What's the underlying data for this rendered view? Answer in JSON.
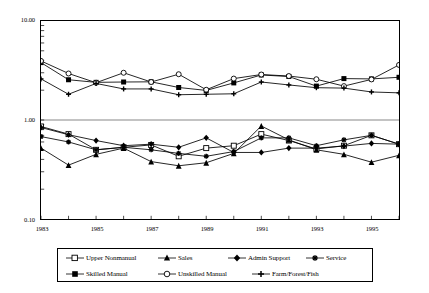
{
  "chart_data": {
    "type": "line",
    "title": "",
    "subtitle": "",
    "xlabel": "",
    "ylabel": "",
    "yscale": "log",
    "ylim": [
      0.1,
      10.0
    ],
    "grid": false,
    "gridlines": [
      "1.00"
    ],
    "legend_position": "bottom",
    "x": [
      1983,
      1984,
      1985,
      1986,
      1987,
      1988,
      1989,
      1990,
      1991,
      1992,
      1993,
      1994,
      1995,
      1996
    ],
    "x_tick_labels": [
      "1983",
      "1985",
      "1987",
      "1989",
      "1991",
      "1993",
      "1995"
    ],
    "x_tick_values": [
      1983,
      1985,
      1987,
      1989,
      1991,
      1993,
      1995
    ],
    "y_tick_labels": [
      "10.00",
      "1.00",
      "0.10"
    ],
    "y_tick_values": [
      10.0,
      1.0,
      0.1
    ],
    "series": [
      {
        "name": "Upper Nonmanual",
        "marker": "open-square",
        "values": [
          0.86,
          0.72,
          0.5,
          0.53,
          0.56,
          0.43,
          0.52,
          0.55,
          0.72,
          0.62,
          0.51,
          0.55,
          0.7,
          0.57
        ]
      },
      {
        "name": "Sales",
        "marker": "filled-triangle",
        "values": [
          0.52,
          0.35,
          0.45,
          0.52,
          0.38,
          0.345,
          0.37,
          0.46,
          0.87,
          0.63,
          0.5,
          0.45,
          0.375,
          0.44
        ]
      },
      {
        "name": "Admin Support",
        "marker": "filled-diamond",
        "values": [
          0.84,
          0.71,
          0.62,
          0.55,
          0.57,
          0.53,
          0.66,
          0.47,
          0.47,
          0.52,
          0.52,
          0.545,
          0.58,
          0.57
        ]
      },
      {
        "name": "Service",
        "marker": "filled-star",
        "values": [
          0.68,
          0.6,
          0.5,
          0.53,
          0.5,
          0.46,
          0.43,
          0.48,
          0.66,
          0.66,
          0.55,
          0.63,
          0.7,
          0.57
        ]
      },
      {
        "name": "Skilled Manual",
        "marker": "filled-square",
        "values": [
          3.8,
          2.55,
          2.4,
          2.42,
          2.43,
          2.13,
          1.99,
          2.37,
          2.85,
          2.75,
          2.2,
          2.62,
          2.6,
          2.7
        ]
      },
      {
        "name": "Unskilled Manual",
        "marker": "open-circle",
        "values": [
          3.95,
          2.95,
          2.38,
          3.0,
          2.42,
          2.9,
          2.02,
          2.62,
          2.88,
          2.78,
          2.58,
          2.2,
          2.57,
          3.6
        ]
      },
      {
        "name": "Farm/Forest/Fish",
        "marker": "plus",
        "values": [
          2.6,
          1.82,
          2.34,
          2.06,
          2.06,
          1.8,
          1.82,
          1.84,
          2.42,
          2.26,
          2.12,
          2.1,
          1.92,
          1.88
        ]
      }
    ],
    "lower_cluster_series": [
      "Upper Nonmanual",
      "Sales",
      "Admin Support",
      "Service"
    ],
    "upper_cluster_series": [
      "Skilled Manual",
      "Unskilled Manual",
      "Farm/Forest/Fish"
    ]
  },
  "axis": {
    "y_top_label": "10.00",
    "y_mid_label": "1.00",
    "y_bottom_label": "0.10",
    "x_labels": [
      "1983",
      "1985",
      "1987",
      "1989",
      "1991",
      "1993",
      "1995"
    ]
  },
  "legend": {
    "row1": [
      {
        "label": "Upper Nonmanual",
        "marker": "open-square"
      },
      {
        "label": "Sales",
        "marker": "filled-triangle"
      },
      {
        "label": "Admin Support",
        "marker": "filled-diamond"
      },
      {
        "label": "Service",
        "marker": "filled-star"
      }
    ],
    "row2": [
      {
        "label": "Skilled Manual",
        "marker": "filled-square"
      },
      {
        "label": "Unskilled Manual",
        "marker": "open-circle"
      },
      {
        "label": "Farm/Forest/Fish",
        "marker": "plus"
      }
    ]
  },
  "colors": {
    "line": "#000000",
    "frame": "#000000",
    "background": "#ffffff",
    "gridline": "#888888"
  }
}
